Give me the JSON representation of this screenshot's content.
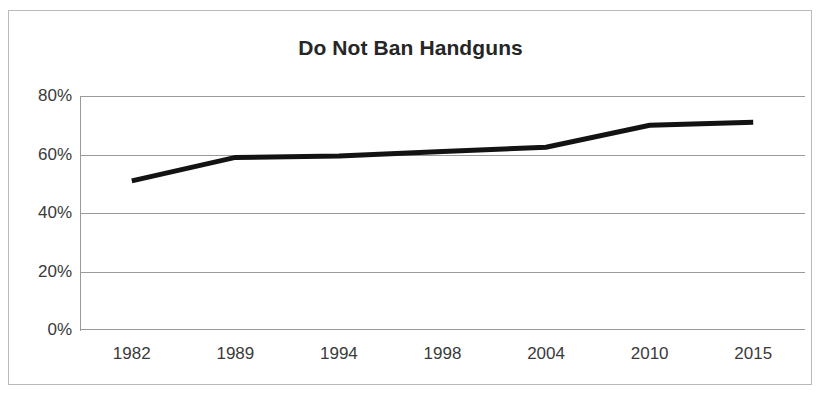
{
  "figure": {
    "title": "Do Not Ban Handguns",
    "background_color": "#ffffff",
    "border_color": "#b9b9b9",
    "title_color": "#262626"
  },
  "chart_data": {
    "type": "line",
    "title": "Do Not Ban Handguns",
    "xlabel": "",
    "ylabel": "",
    "categories": [
      "1982",
      "1989",
      "1994",
      "1998",
      "2004",
      "2010",
      "2015"
    ],
    "values": [
      51,
      59,
      59.5,
      61,
      62.5,
      70,
      71
    ],
    "series": [
      {
        "name": "Do Not Ban Handguns",
        "color": "#131313",
        "values": [
          51,
          59,
          59.5,
          61,
          62.5,
          70,
          71
        ]
      }
    ],
    "ylim": [
      0,
      80
    ],
    "ytick_values": [
      0,
      20,
      40,
      60,
      80
    ],
    "ytick_labels": [
      "0%",
      "20%",
      "40%",
      "60%",
      "80%"
    ],
    "xtick_labels": [
      "1982",
      "1989",
      "1994",
      "1998",
      "2004",
      "2010",
      "2015"
    ],
    "grid": "horizontal",
    "grid_color": "#9a9a9a",
    "legend": "none",
    "units": "percent",
    "line_width_px": 5,
    "markers": "none"
  }
}
